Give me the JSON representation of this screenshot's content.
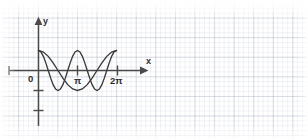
{
  "figure": {
    "kind": "coordinate-plane-graph",
    "background": "#ffffff",
    "grid_color": "#96a0b4",
    "axis_color": "#4a4a4a",
    "curve_color": "#3a3a3a",
    "corner_artifact": "",
    "axes": {
      "x_label": "x",
      "y_label": "y",
      "origin_label": "0",
      "x_ticks": [
        {
          "label": "π",
          "value": 3.1416
        },
        {
          "label": "2π",
          "value": 6.2832
        }
      ],
      "y_ticks": [
        {
          "label": "",
          "value": -1
        },
        {
          "label": "",
          "value": -2
        }
      ]
    }
  },
  "chart_data": {
    "type": "line",
    "title": "",
    "xlabel": "x",
    "ylabel": "y",
    "grid": true,
    "legend": "none",
    "xlim": [
      -0.55,
      7.9
    ],
    "ylim": [
      -2.6,
      2.05
    ],
    "x_tick_values": [
      3.1416,
      6.2832
    ],
    "x_tick_labels": [
      "π",
      "2π"
    ],
    "y_tick_values": [
      -1,
      -2
    ],
    "y_tick_labels": [
      "",
      ""
    ],
    "series": [
      {
        "name": "cos x",
        "expression": "y = cos(x)",
        "x": [
          0,
          0.3927,
          0.7854,
          1.1781,
          1.5708,
          1.9635,
          2.3562,
          2.7489,
          3.1416,
          3.5343,
          3.927,
          4.3197,
          4.7124,
          5.1051,
          5.4978,
          5.8905,
          6.2832
        ],
        "y": [
          1,
          0.9239,
          0.7071,
          0.3827,
          0,
          -0.3827,
          -0.7071,
          -0.9239,
          -1,
          -0.9239,
          -0.7071,
          -0.3827,
          0,
          0.3827,
          0.7071,
          0.9239,
          1
        ]
      },
      {
        "name": "cos 2x",
        "expression": "y = cos(2x)",
        "x": [
          0,
          0.19635,
          0.3927,
          0.58905,
          0.7854,
          0.98175,
          1.1781,
          1.37445,
          1.5708,
          1.76715,
          1.9635,
          2.15985,
          2.3562,
          2.55255,
          2.7489,
          2.94525,
          3.1416,
          3.33795,
          3.5343,
          3.73065,
          3.927,
          4.12335,
          4.3197,
          4.51605,
          4.7124,
          4.90875,
          5.1051,
          5.30145,
          5.4978,
          5.69415,
          5.8905,
          6.08685,
          6.2832
        ],
        "y": [
          1,
          0.9239,
          0.7071,
          0.3827,
          0,
          -0.3827,
          -0.7071,
          -0.9239,
          -1,
          -0.9239,
          -0.7071,
          -0.3827,
          0,
          0.3827,
          0.7071,
          0.9239,
          1,
          0.9239,
          0.7071,
          0.3827,
          0,
          -0.3827,
          -0.7071,
          -0.9239,
          -1,
          -0.9239,
          -0.7071,
          -0.3827,
          0,
          0.3827,
          0.7071,
          0.9239,
          1
        ]
      }
    ]
  }
}
